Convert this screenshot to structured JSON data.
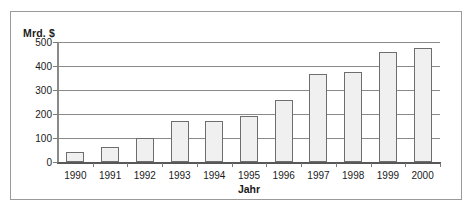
{
  "chart_data": {
    "type": "bar",
    "title": "",
    "xlabel": "Jahr",
    "ylabel": "Mrd. $",
    "categories": [
      "1990",
      "1991",
      "1992",
      "1993",
      "1994",
      "1995",
      "1996",
      "1997",
      "1998",
      "1999",
      "2000"
    ],
    "values": [
      40,
      62,
      100,
      170,
      170,
      190,
      258,
      368,
      375,
      458,
      475
    ],
    "ylim": [
      0,
      500
    ],
    "ytick_labels": [
      "500",
      "400",
      "300",
      "200",
      "100",
      "0"
    ],
    "ytick_values": [
      500,
      400,
      300,
      200,
      100,
      0
    ],
    "grid": true,
    "legend": "none",
    "bar_fill_color": "#f0f0f0",
    "bar_border_color": "#6e6e6e",
    "gridline_color": "#8a8a8a",
    "axis_color": "#585858",
    "frame_color": "#9a9a9a",
    "text_color": "#1a1a1a"
  }
}
